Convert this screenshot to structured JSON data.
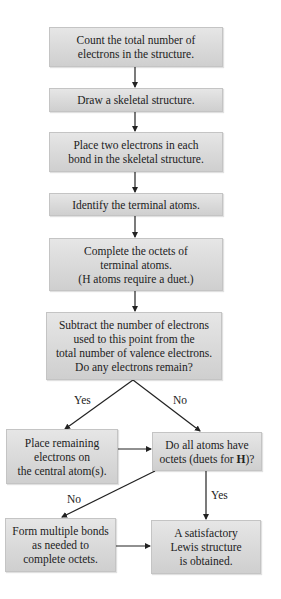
{
  "flowchart": {
    "title": "Procedure for drawing Lewis structures",
    "steps": [
      {
        "id": "count",
        "text": "Count the total number of\nelectrons in the structure."
      },
      {
        "id": "skeleton",
        "text": "Draw a skeletal structure."
      },
      {
        "id": "place-bonds",
        "text": "Place two electrons in each\nbond in the skeletal structure."
      },
      {
        "id": "terminal",
        "text": "Identify the terminal atoms."
      },
      {
        "id": "octets",
        "text": "Complete the octets of\nterminal atoms.\n(H atoms require a duet.)"
      },
      {
        "id": "subtract",
        "text": "Subtract the number of electrons\nused to this point from the\ntotal number of valence electrons.\nDo any electrons remain?"
      },
      {
        "id": "place-remaining",
        "text": "Place remaining\nelectrons on\nthe central atom(s)."
      },
      {
        "id": "check-octets",
        "text_before": "Do all atoms have\noctets (duets for ",
        "text_bold": "H",
        "text_after": ")?"
      },
      {
        "id": "multiple-bonds",
        "text": "Form multiple bonds\nas needed to\ncomplete octets."
      },
      {
        "id": "done",
        "text": "A satisfactory\nLewis structure\nis obtained."
      }
    ],
    "labels": {
      "yes_remain": "Yes",
      "no_remain": "No",
      "no_octets": "No",
      "yes_octets": "Yes"
    },
    "colors": {
      "box_fill": "#d9d9d9",
      "box_border": "#c4c4c4",
      "arrow": "#222222",
      "background": "#ffffff"
    }
  }
}
